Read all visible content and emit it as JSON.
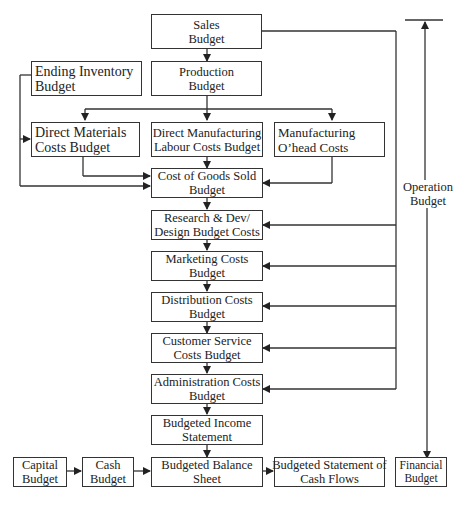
{
  "diagram": {
    "nodes": {
      "sales": [
        "Sales",
        "Budget"
      ],
      "production": [
        "Production",
        "Budget"
      ],
      "ending_inventory": [
        "Ending Inventory",
        "Budget"
      ],
      "direct_materials": [
        "Direct Materials",
        "Costs Budget"
      ],
      "direct_labour": [
        "Direct Manufacturing",
        "Labour Costs Budget"
      ],
      "mfg_overhead": [
        "Manufacturing",
        "O’head Costs"
      ],
      "cogs": [
        "Cost of Goods Sold",
        "Budget"
      ],
      "rnd": [
        "Research & Dev/",
        "Design Budget Costs"
      ],
      "marketing": [
        "Marketing Costs",
        "Budget"
      ],
      "distribution": [
        "Distribution Costs",
        "Budget"
      ],
      "customer_service": [
        "Customer Service",
        "Costs Budget"
      ],
      "administration": [
        "Administration Costs",
        "Budget"
      ],
      "income_statement": [
        "Budgeted Income",
        "Statement"
      ],
      "capital": [
        "Capital",
        "Budget"
      ],
      "cash": [
        "Cash",
        "Budget"
      ],
      "balance_sheet": [
        "Budgeted Balance",
        "Sheet"
      ],
      "cash_flows": [
        "Budgeted Statement of",
        "Cash Flows"
      ],
      "financial": [
        "Financial",
        "Budget"
      ]
    },
    "labels": {
      "operation_budget": [
        "Operation",
        "Budget"
      ]
    },
    "edges": [
      [
        "sales",
        "production"
      ],
      [
        "sales",
        "rnd"
      ],
      [
        "sales",
        "marketing"
      ],
      [
        "sales",
        "distribution"
      ],
      [
        "sales",
        "customer_service"
      ],
      [
        "sales",
        "administration"
      ],
      [
        "production",
        "direct_materials"
      ],
      [
        "production",
        "direct_labour"
      ],
      [
        "production",
        "mfg_overhead"
      ],
      [
        "ending_inventory",
        "direct_materials"
      ],
      [
        "ending_inventory",
        "cogs"
      ],
      [
        "direct_materials",
        "cogs"
      ],
      [
        "direct_labour",
        "cogs"
      ],
      [
        "mfg_overhead",
        "cogs"
      ],
      [
        "cogs",
        "rnd"
      ],
      [
        "rnd",
        "marketing"
      ],
      [
        "marketing",
        "distribution"
      ],
      [
        "distribution",
        "customer_service"
      ],
      [
        "customer_service",
        "administration"
      ],
      [
        "administration",
        "income_statement"
      ],
      [
        "income_statement",
        "balance_sheet"
      ],
      [
        "capital",
        "cash"
      ],
      [
        "cash",
        "balance_sheet"
      ],
      [
        "balance_sheet",
        "cash_flows"
      ]
    ]
  }
}
